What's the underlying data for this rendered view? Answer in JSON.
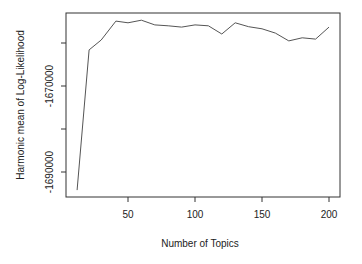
{
  "chart_data": {
    "type": "line",
    "title": "",
    "xlabel": "Number of Topics",
    "ylabel": "Harmonic mean of Log-Likelihood",
    "xlim": [
      5,
      208
    ],
    "ylim": [
      -1696000,
      -1653000
    ],
    "x_ticks": [
      50,
      100,
      150,
      200
    ],
    "x_tick_labels": [
      "50",
      "100",
      "150",
      "200"
    ],
    "y_ticks": [
      -1660000,
      -1670000,
      -1680000,
      -1690000
    ],
    "y_tick_labels": [
      "",
      "-1670000",
      "",
      "-1690000"
    ],
    "grid": false,
    "legend": null,
    "series": [
      {
        "name": "harmonic mean",
        "color": "#555555",
        "x": [
          12,
          21,
          30,
          41,
          50,
          60,
          70,
          80,
          90,
          100,
          110,
          120,
          130,
          140,
          150,
          160,
          170,
          180,
          190,
          200
        ],
        "values": [
          -1694200,
          -1661600,
          -1659300,
          -1654900,
          -1655300,
          -1654700,
          -1655800,
          -1656000,
          -1656300,
          -1655800,
          -1656000,
          -1657900,
          -1655300,
          -1656200,
          -1656700,
          -1657700,
          -1659500,
          -1658800,
          -1659100,
          -1656300
        ]
      }
    ]
  }
}
